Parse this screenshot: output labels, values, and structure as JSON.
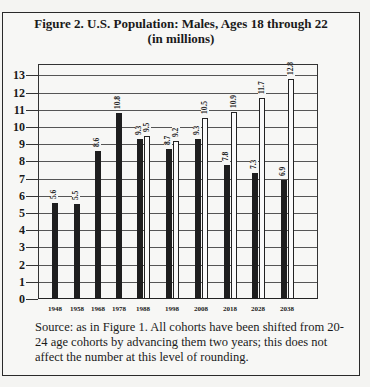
{
  "figure": {
    "title_line1": "Figure 2. U.S. Population: Males, Ages 18 through 22",
    "title_line2": "(in millions)",
    "source_note": "Source: as in Figure 1. All cohorts have been shifted from 20-24 age cohorts by advancing them two years; this does not affect the number at this level of rounding."
  },
  "chart_data": {
    "type": "bar",
    "title": "Figure 2. U.S. Population: Males, Ages 18 through 22 (in millions)",
    "xlabel": "",
    "ylabel": "",
    "ylim": [
      0,
      13
    ],
    "yticks": [
      0,
      1,
      2,
      3,
      4,
      5,
      6,
      7,
      8,
      9,
      10,
      11,
      12,
      13
    ],
    "grid": true,
    "legend": null,
    "categories": [
      "1948",
      "1958",
      "1968",
      "1978",
      "1988",
      "1998",
      "2008",
      "2018",
      "2028",
      "2038"
    ],
    "series": [
      {
        "name": "dark bars",
        "style": "solid-black",
        "values": [
          5.6,
          5.5,
          8.6,
          10.8,
          9.3,
          8.7,
          9.3,
          7.8,
          7.3,
          6.9
        ]
      },
      {
        "name": "outline bars",
        "style": "white-outlined",
        "values": [
          null,
          null,
          null,
          null,
          9.5,
          9.2,
          10.5,
          10.9,
          11.7,
          12.8
        ]
      }
    ]
  },
  "colors": {
    "bar_dark": "#1e1e1e",
    "bar_outline_fill": "#fafafa",
    "grid": "#555555"
  }
}
